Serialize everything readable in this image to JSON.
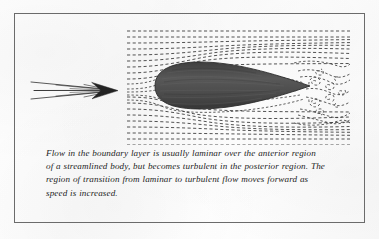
{
  "figure": {
    "frame": {
      "border_color": "#6b6b6b",
      "background_color": "#fdfdfd"
    },
    "caption": {
      "lines": [
        "Flow in the boundary layer is usually laminar over the anterior region",
        "of a streamlined body, but becomes turbulent in the posterior region. The",
        "region of transition from laminar to turbulent flow moves forward as",
        "speed is increased."
      ],
      "full_text": "Flow in the boundary layer is usually laminar over the anterior region of a streamlined body, but becomes turbulent in the posterior region. The region of transition from laminar to turbulent flow moves forward as speed is increased.",
      "style": "italic-serif",
      "text_color": "#1d1d1d"
    },
    "diagram": {
      "title": "boundary-layer-flow-over-streamlined-body",
      "elements": {
        "flow_direction_arrow": {
          "name": "flow-direction-arrow",
          "description": "thin multi-stroke arrow pointing right indicating oncoming free-stream flow",
          "color": "#2a2a2a"
        },
        "streamlined_body": {
          "name": "streamlined-body",
          "description": "dark teardrop / airfoil section with rounded leading edge and pointed trailing edge",
          "fill_color": "#4a4a4a"
        },
        "laminar_streamlines": {
          "name": "laminar-streamlines",
          "description": "dashed horizontal streamlines over the anterior region, smooth and parallel",
          "color": "#333333",
          "style": "dashed"
        },
        "turbulent_wake": {
          "name": "turbulent-wake",
          "description": "swirling eddies and broken dashed streamlines in the posterior region behind the body",
          "color": "#333333",
          "style": "dashed-curled"
        }
      },
      "regions": {
        "anterior": "laminar",
        "posterior": "turbulent"
      }
    }
  }
}
